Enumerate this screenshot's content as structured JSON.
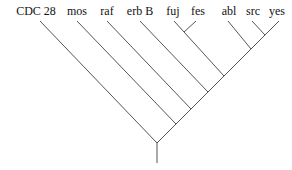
{
  "diagram": {
    "type": "phylogenetic-tree",
    "taxa": [
      "CDC 28",
      "mos",
      "raf",
      "erb B",
      "fuj",
      "fes",
      "abl",
      "src",
      "yes"
    ],
    "line_color": "#555555"
  }
}
